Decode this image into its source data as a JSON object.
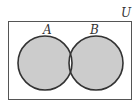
{
  "diagram": {
    "type": "venn",
    "universe_label": "U",
    "sets": [
      {
        "label": "A"
      },
      {
        "label": "B"
      }
    ],
    "shaded_region": "symmetric difference (A Δ B)",
    "colors": {
      "fill": "#cccccc",
      "stroke": "#333333",
      "background": "#ffffff"
    }
  }
}
